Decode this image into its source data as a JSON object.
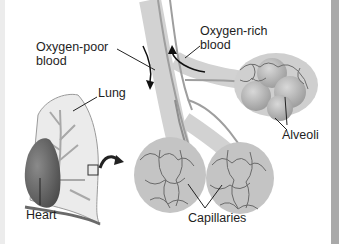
{
  "diagram": {
    "labels": {
      "oxygen_poor_line1": "Oxygen-poor",
      "oxygen_poor_line2": "blood",
      "oxygen_rich_line1": "Oxygen-rich",
      "oxygen_rich_line2": "blood",
      "lung": "Lung",
      "heart": "Heart",
      "alveoli": "Alveoli",
      "capillaries": "Capillaries"
    },
    "colors": {
      "lung_fill": "#e9e9e9",
      "bronchi": "#b5b5b5",
      "heart": "#6a6a6a",
      "alveoli": "#bdbdbd",
      "capillary": "#6e6e6e",
      "edge_bar": "#a9a9a9"
    }
  }
}
